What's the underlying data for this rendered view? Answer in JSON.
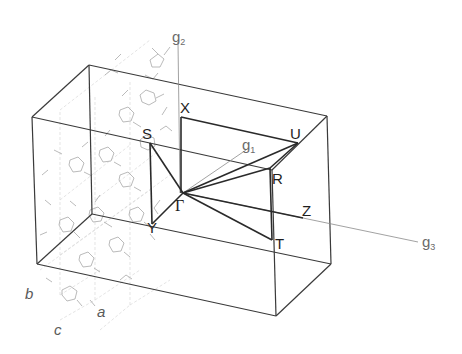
{
  "diagram": {
    "type": "brillouin-zone",
    "points": {
      "Gamma": "Γ",
      "X": "X",
      "S": "S",
      "Y": "Y",
      "U": "U",
      "R": "R",
      "Z": "Z",
      "T": "T"
    },
    "reciprocal_axes": {
      "g1": {
        "base": "g",
        "sub": "1"
      },
      "g2": {
        "base": "g",
        "sub": "2"
      },
      "g3": {
        "base": "g",
        "sub": "3"
      }
    },
    "lattice_axes": {
      "a": "a",
      "b": "b",
      "c": "c"
    },
    "path": [
      "X",
      "U",
      "Γ",
      "S",
      "Y",
      "Γ",
      "R",
      "T",
      "Γ",
      "Z"
    ],
    "colors": {
      "edge": "#3a3a3a",
      "path": "#2a2a2a",
      "axis": "#8a8a8a",
      "molecule": "#a8a8a8"
    }
  }
}
